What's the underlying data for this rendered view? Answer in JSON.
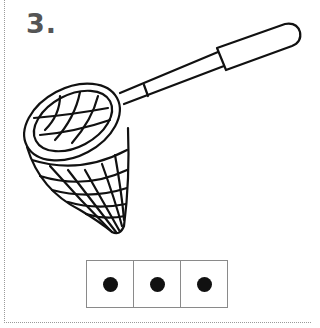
{
  "exercise": {
    "number_label": "3.",
    "image_subject": "butterfly-net",
    "count_boxes": {
      "cells": [
        {
          "filled": true
        },
        {
          "filled": true
        },
        {
          "filled": true
        }
      ],
      "dot_count": 3
    }
  },
  "colors": {
    "number": "#555555",
    "line": "#111111",
    "border": "#9a9a9a"
  }
}
